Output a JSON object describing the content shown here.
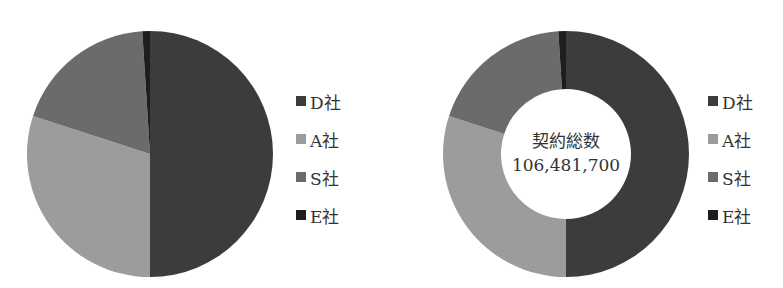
{
  "chart_data": [
    {
      "type": "pie",
      "title": "",
      "categories": [
        "D社",
        "A社",
        "S社",
        "E社"
      ],
      "values": [
        50,
        30,
        19,
        1
      ],
      "unit": "percent (estimated)",
      "colors": [
        "#3c3c3c",
        "#9c9c9c",
        "#6b6b6b",
        "#1e1e1e"
      ],
      "start_angle_deg": 0,
      "direction": "clockwise",
      "legend_position": "right"
    },
    {
      "type": "pie",
      "variant": "donut",
      "title": "",
      "center_label": "契約総数",
      "center_value": "106,481,700",
      "categories": [
        "D社",
        "A社",
        "S社",
        "E社"
      ],
      "values": [
        50,
        30,
        19,
        1
      ],
      "unit": "percent (estimated)",
      "colors": [
        "#3c3c3c",
        "#9c9c9c",
        "#6b6b6b",
        "#1e1e1e"
      ],
      "start_angle_deg": 0,
      "direction": "clockwise",
      "legend_position": "right"
    }
  ],
  "pie": {
    "legend": [
      {
        "label": "D社",
        "color": "#3c3c3c"
      },
      {
        "label": "A社",
        "color": "#9c9c9c"
      },
      {
        "label": "S社",
        "color": "#6b6b6b"
      },
      {
        "label": "E社",
        "color": "#1e1e1e"
      }
    ]
  },
  "donut": {
    "center_title": "契約総数",
    "center_value": "106,481,700",
    "legend": [
      {
        "label": "D社",
        "color": "#3c3c3c"
      },
      {
        "label": "A社",
        "color": "#9c9c9c"
      },
      {
        "label": "S社",
        "color": "#6b6b6b"
      },
      {
        "label": "E社",
        "color": "#1e1e1e"
      }
    ]
  }
}
